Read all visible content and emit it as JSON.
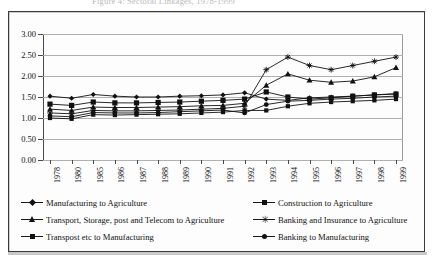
{
  "title_fragment": "Figure 4: Sectoral Linkages, 1978-1999",
  "chart_data": {
    "type": "line",
    "title": "",
    "xlabel": "",
    "ylabel": "",
    "ylim": [
      0.0,
      3.0
    ],
    "ytick_step": 0.5,
    "ytick_labels": [
      "0.00",
      "0.50",
      "1.00",
      "1.50",
      "2.00",
      "2.50",
      "3.00"
    ],
    "grid": true,
    "legend_position": "bottom",
    "categories": [
      "1978",
      "1980",
      "1985",
      "1986",
      "1987",
      "1988",
      "1989",
      "1990",
      "1991",
      "1992",
      "1993",
      "1994",
      "1995",
      "1996",
      "1997",
      "1998",
      "1999"
    ],
    "series": [
      {
        "name": "Manufacturing to Agriculture",
        "marker": "diamond",
        "values": [
          1.52,
          1.47,
          1.56,
          1.52,
          1.5,
          1.5,
          1.52,
          1.53,
          1.55,
          1.6,
          1.45,
          1.42,
          1.48,
          1.5,
          1.52,
          1.55,
          1.58
        ]
      },
      {
        "name": "Construction to Agriculture",
        "marker": "square",
        "values": [
          1.33,
          1.3,
          1.38,
          1.36,
          1.36,
          1.37,
          1.38,
          1.4,
          1.42,
          1.45,
          1.62,
          1.5,
          1.45,
          1.48,
          1.52,
          1.55,
          1.57
        ]
      },
      {
        "name": "Transport, Storage, post and Telecom to Agriculture",
        "marker": "triangle",
        "values": [
          1.21,
          1.18,
          1.26,
          1.25,
          1.25,
          1.26,
          1.27,
          1.29,
          1.3,
          1.35,
          1.78,
          2.05,
          1.9,
          1.85,
          1.88,
          1.98,
          2.2
        ]
      },
      {
        "name": "Banking and Insurance to Agriculture",
        "marker": "asterisk",
        "values": [
          1.12,
          1.1,
          1.18,
          1.17,
          1.17,
          1.18,
          1.19,
          1.21,
          1.23,
          1.28,
          2.15,
          2.45,
          2.25,
          2.15,
          2.25,
          2.35,
          2.45
        ]
      },
      {
        "name": "Transpost etc to Manufacturing",
        "marker": "square-small",
        "values": [
          1.0,
          0.98,
          1.08,
          1.07,
          1.08,
          1.09,
          1.1,
          1.12,
          1.14,
          1.18,
          1.18,
          1.28,
          1.35,
          1.38,
          1.4,
          1.42,
          1.45
        ]
      },
      {
        "name": "Banking to Manufacturing",
        "marker": "dot",
        "values": [
          1.05,
          1.03,
          1.13,
          1.12,
          1.12,
          1.13,
          1.15,
          1.17,
          1.19,
          1.12,
          1.32,
          1.4,
          1.42,
          1.45,
          1.47,
          1.5,
          1.52
        ]
      }
    ]
  },
  "legend": {
    "left": [
      "Manufacturing to Agriculture",
      "Transport, Storage, post and Telecom to Agriculture",
      "Transpost etc to Manufacturing"
    ],
    "right": [
      "Construction to Agriculture",
      "Banking and Insurance to Agriculture",
      "Banking to Manufacturing"
    ]
  }
}
